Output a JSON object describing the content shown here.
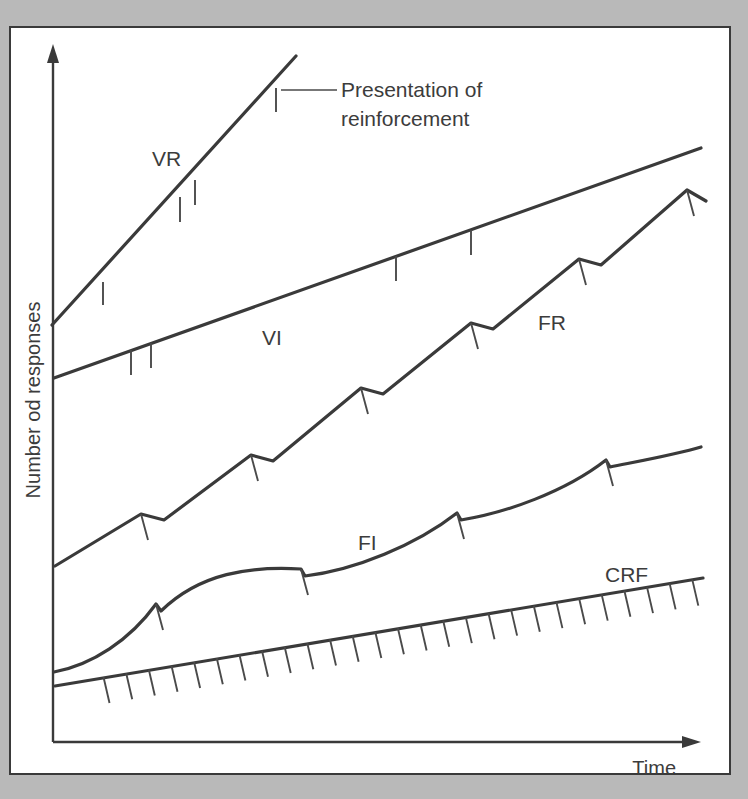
{
  "figure": {
    "background_color": "#b9b9b9",
    "panel_color": "#ffffff",
    "ink_color": "#3a3a3a",
    "axes": {
      "y_label": "Number od responses",
      "x_label": "Time"
    },
    "annotation": {
      "text_line_1": "Presentation of",
      "text_line_2": "reinforcement"
    },
    "curve_labels": {
      "vr": "VR",
      "vi": "VI",
      "fr": "FR",
      "fi": "FI",
      "crf": "CRF"
    }
  },
  "chart_data": {
    "type": "line",
    "title": "",
    "subtitle": "",
    "xlabel": "Time",
    "ylabel": "Number od responses",
    "xlim": [
      0,
      100
    ],
    "ylim": [
      0,
      100
    ],
    "grid": false,
    "legend": "inline-curve-labels",
    "axis_style": "arrows, no tick labels, cumulative-record schematic",
    "annotations": [
      {
        "text": "Presentation of reinforcement",
        "points_to": "hash mark on VR record",
        "anchor_xy_px": [
          275,
          88
        ],
        "label_xy_px": [
          340,
          95
        ]
      }
    ],
    "series": [
      {
        "name": "VR",
        "label": "VR",
        "description": "Variable ratio: high steady rate, reinforcers at irregular intervals, no post-reinforcement pause",
        "slope": "steepest",
        "label_xy_px": [
          152,
          158
        ],
        "points_px": [
          [
            52,
            325
          ],
          [
            295,
            57
          ]
        ],
        "reinforcement_marks_px": [
          [
            103,
            282
          ],
          [
            180,
            197
          ],
          [
            194,
            181
          ],
          [
            275,
            88
          ]
        ]
      },
      {
        "name": "VI",
        "label": "VI",
        "description": "Variable interval: low steady rate, reinforcers at irregular intervals",
        "slope": "shallow-steady",
        "label_xy_px": [
          262,
          337
        ],
        "points_px": [
          [
            54,
            378
          ],
          [
            700,
            148
          ]
        ],
        "reinforcement_marks_px": [
          [
            131,
            351
          ],
          [
            150,
            344
          ],
          [
            395,
            257
          ],
          [
            470,
            231
          ]
        ]
      },
      {
        "name": "FR",
        "label": "FR",
        "description": "Fixed ratio: high rate with brief post-reinforcement pause producing stair-step record",
        "slope": "steep-stepped",
        "label_xy_px": [
          538,
          322
        ],
        "points_px": [
          [
            55,
            565
          ],
          [
            140,
            515
          ],
          [
            163,
            519
          ],
          [
            250,
            455
          ],
          [
            272,
            460
          ],
          [
            360,
            388
          ],
          [
            382,
            394
          ],
          [
            470,
            323
          ],
          [
            492,
            329
          ],
          [
            578,
            259
          ],
          [
            600,
            265
          ],
          [
            686,
            190
          ],
          [
            704,
            200
          ]
        ],
        "reinforcement_marks_px": [
          [
            140,
            515
          ],
          [
            250,
            455
          ],
          [
            360,
            388
          ],
          [
            470,
            323
          ],
          [
            578,
            259
          ],
          [
            686,
            190
          ]
        ]
      },
      {
        "name": "FI",
        "label": "FI",
        "description": "Fixed interval: scalloped record, pause after reinforcement then accelerating rate",
        "slope": "scalloped",
        "label_xy_px": [
          358,
          542
        ],
        "points_px": [
          [
            54,
            672
          ],
          [
            155,
            604
          ],
          [
            160,
            610
          ],
          [
            300,
            570
          ],
          [
            303,
            576
          ],
          [
            455,
            513
          ],
          [
            458,
            519
          ],
          [
            605,
            460
          ],
          [
            608,
            466
          ],
          [
            700,
            448
          ]
        ],
        "reinforcement_marks_px": [
          [
            155,
            604
          ],
          [
            300,
            570
          ],
          [
            455,
            513
          ],
          [
            605,
            460
          ]
        ]
      },
      {
        "name": "CRF",
        "label": "CRF",
        "description": "Continuous reinforcement: every response reinforced, slow steady rate with a hash mark per response",
        "slope": "shallowest",
        "label_xy_px": [
          605,
          574
        ],
        "points_px": [
          [
            55,
            685
          ],
          [
            702,
            578
          ]
        ],
        "reinforcement_marks_count": 27
      }
    ]
  }
}
